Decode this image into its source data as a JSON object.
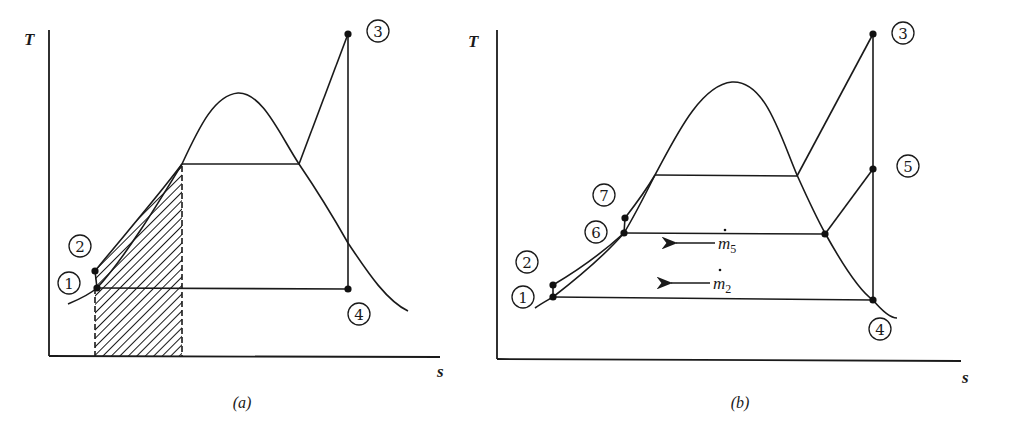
{
  "figure": {
    "panels": [
      {
        "id": "a",
        "caption": "(a)",
        "y_axis_label": "T",
        "x_axis_label": "s",
        "points": [
          {
            "id": "1",
            "label": "1"
          },
          {
            "id": "2",
            "label": "2"
          },
          {
            "id": "3",
            "label": "3"
          },
          {
            "id": "4",
            "label": "4"
          }
        ],
        "annotations": [
          "hatched area under liquid heating curve (2 to saturated liquid)"
        ]
      },
      {
        "id": "b",
        "caption": "(b)",
        "y_axis_label": "T",
        "x_axis_label": "s",
        "points": [
          {
            "id": "1",
            "label": "1"
          },
          {
            "id": "2",
            "label": "2"
          },
          {
            "id": "3",
            "label": "3"
          },
          {
            "id": "4",
            "label": "4"
          },
          {
            "id": "5",
            "label": "5"
          },
          {
            "id": "6",
            "label": "6"
          },
          {
            "id": "7",
            "label": "7"
          }
        ],
        "flow_labels": [
          {
            "id": "m5",
            "base": "m",
            "subscript": "5",
            "dot": true,
            "arrow": "left"
          },
          {
            "id": "m2",
            "base": "m",
            "subscript": "2",
            "dot": true,
            "arrow": "left"
          }
        ]
      }
    ]
  }
}
